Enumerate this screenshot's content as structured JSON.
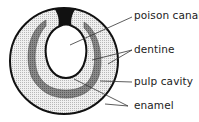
{
  "diagram": {
    "labels": [
      {
        "id": "poison-canal",
        "text": "poison canal",
        "x": 134,
        "y": 9
      },
      {
        "id": "dentine",
        "text": "dentine",
        "x": 134,
        "y": 43
      },
      {
        "id": "pulp-cavity",
        "text": "pulp cavity",
        "x": 134,
        "y": 75
      },
      {
        "id": "enamel",
        "text": "enamel",
        "x": 134,
        "y": 99
      }
    ],
    "colors": {
      "outline": "#111111",
      "dentine_fill": "#e4e4e4",
      "pulp_fill": "#9a9a9a",
      "background": "#ffffff"
    }
  }
}
